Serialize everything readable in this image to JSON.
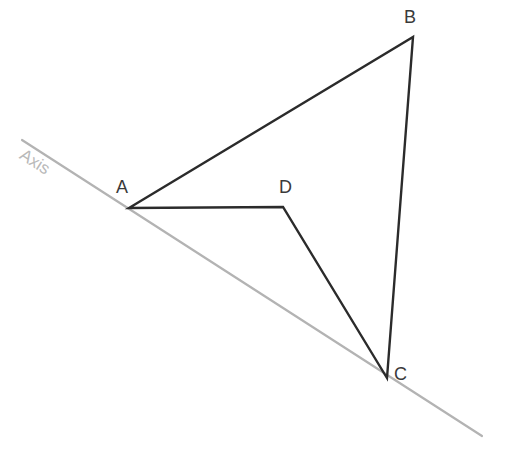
{
  "canvas": {
    "width": 509,
    "height": 458,
    "background": "#ffffff"
  },
  "styles": {
    "shape_stroke": "#2b2b2b",
    "shape_stroke_width": 2.4,
    "axis_stroke": "#b3b3b3",
    "axis_stroke_width": 2.2,
    "label_color": "#3a3a3a",
    "axis_label_color": "#b9b9b9"
  },
  "axis": {
    "label": "Axis",
    "label_x": 26,
    "label_y": 146,
    "label_rotation_deg": 32.8,
    "x1": 22,
    "y1": 140,
    "x2": 482,
    "y2": 436
  },
  "top_clipped_text": "",
  "figure": {
    "type": "polygon",
    "closed": true,
    "name": "quadrilateral-abcd",
    "path": "M 129 208 L 413 37 L 387 378 L 283 207 Z",
    "vertices": [
      {
        "id": "A",
        "label": "A",
        "x": 129,
        "y": 208,
        "label_x": 116,
        "label_y": 178,
        "on_axis": true
      },
      {
        "id": "B",
        "label": "B",
        "x": 413,
        "y": 37,
        "label_x": 404,
        "label_y": 8,
        "on_axis": false
      },
      {
        "id": "C",
        "label": "C",
        "x": 387,
        "y": 378,
        "label_x": 394,
        "label_y": 365,
        "on_axis": true
      },
      {
        "id": "D",
        "label": "D",
        "x": 283,
        "y": 207,
        "label_x": 279,
        "label_y": 178,
        "on_axis": false
      }
    ],
    "edges": [
      {
        "from": "A",
        "to": "B"
      },
      {
        "from": "B",
        "to": "C"
      },
      {
        "from": "C",
        "to": "D"
      },
      {
        "from": "D",
        "to": "A"
      }
    ]
  }
}
